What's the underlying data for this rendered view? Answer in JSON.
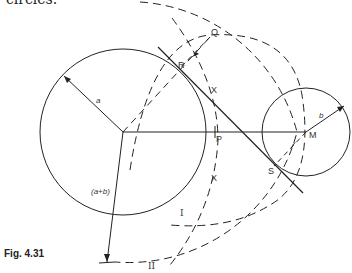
{
  "page": {
    "top_text": "circles.",
    "caption": "Fig. 4.31"
  },
  "diagram": {
    "labels": {
      "a": "a",
      "b": "b",
      "a_plus_b": "(a+b)",
      "Q": "Q",
      "R": "R",
      "P": "P",
      "M": "M",
      "S": "S",
      "arc_I": "I",
      "arc_II": "II",
      "cross_upper": "X",
      "cross_lower": "X"
    },
    "colors": {
      "stroke": "#222222",
      "background": "#ffffff"
    }
  }
}
